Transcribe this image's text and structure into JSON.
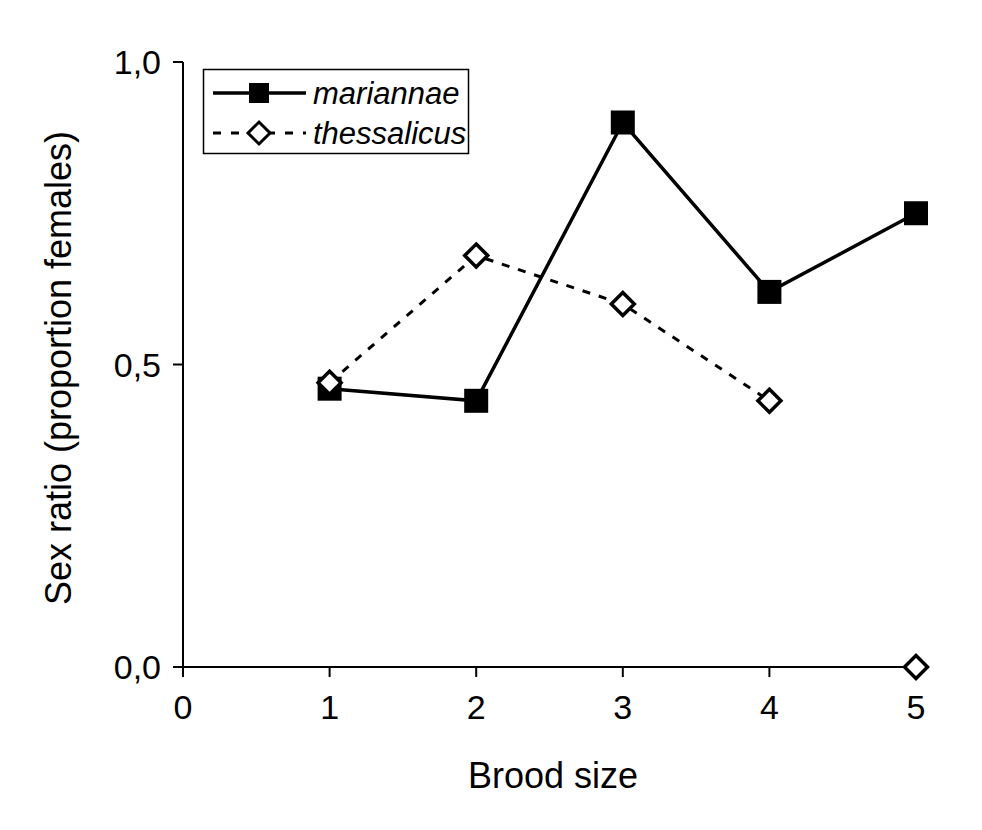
{
  "chart_data": {
    "type": "line",
    "title": "",
    "xlabel": "Brood size",
    "ylabel": "Sex ratio (proportion females)",
    "xlim": [
      0,
      5
    ],
    "ylim": [
      0.0,
      1.0
    ],
    "grid": false,
    "decimal_separator": "comma",
    "x_tick_values": [
      0,
      1,
      2,
      3,
      4,
      5
    ],
    "x_tick_labels": [
      "0",
      "1",
      "2",
      "3",
      "4",
      "5"
    ],
    "y_tick_values": [
      0.0,
      0.5,
      1.0
    ],
    "y_tick_labels": [
      "0,0",
      "0,5",
      "1,0"
    ],
    "legend": {
      "position": "top-left-inside",
      "border": true
    },
    "colors": {
      "foreground": "#000000",
      "background": "#ffffff"
    },
    "series": [
      {
        "name": "mariannae",
        "line_style": "solid",
        "marker": "filled-square",
        "color": "#000000",
        "marker_fill": "#000000",
        "x": [
          1,
          2,
          3,
          4,
          5
        ],
        "y": [
          0.46,
          0.44,
          0.9,
          0.62,
          0.75
        ]
      },
      {
        "name": "thessalicus",
        "line_style": "dashed",
        "marker": "open-diamond",
        "color": "#000000",
        "marker_fill": "#ffffff",
        "x": [
          1,
          2,
          3,
          4,
          5
        ],
        "y": [
          0.47,
          0.68,
          0.6,
          0.44,
          0.0
        ],
        "connect_first_n_points": 4
      }
    ]
  }
}
